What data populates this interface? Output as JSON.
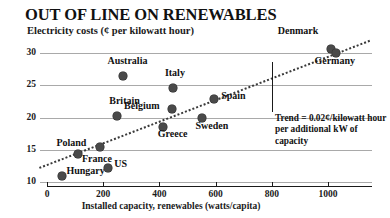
{
  "chart_data": {
    "type": "scatter",
    "title": "OUT OF LINE ON RENEWABLES",
    "subtitle": "Electricity costs (¢ per kilowatt hour)",
    "xlabel": "Installed capacity, renewables (watts/capita)",
    "ylabel": "",
    "xlim": [
      0,
      1150
    ],
    "ylim": [
      9,
      32
    ],
    "xticks": [
      0,
      200,
      400,
      600,
      800,
      1000
    ],
    "xtick_labels": [
      "0",
      "200",
      "400",
      "600",
      "800",
      "1000"
    ],
    "yticks": [
      10,
      15,
      20,
      25,
      30
    ],
    "ytick_labels": [
      "10",
      "15",
      "20",
      "25",
      "30"
    ],
    "grid": true,
    "legend": false,
    "points": [
      {
        "label": "Hungary",
        "x": 55,
        "y": 11.0,
        "label_dx": 4,
        "label_dy": -6
      },
      {
        "label": "France",
        "x": 110,
        "y": 14.3,
        "label_dx": 4,
        "label_dy": 4
      },
      {
        "label": "Poland",
        "x": 190,
        "y": 15.5,
        "label_dx": -44,
        "label_dy": -5
      },
      {
        "label": "US",
        "x": 218,
        "y": 12.1,
        "label_dx": 6,
        "label_dy": -5
      },
      {
        "label": "Britain",
        "x": 250,
        "y": 20.2,
        "label_dx": -8,
        "label_dy": -16
      },
      {
        "label": "Australia",
        "x": 272,
        "y": 26.4,
        "label_dx": -16,
        "label_dy": -16
      },
      {
        "label": "Greece",
        "x": 412,
        "y": 18.6,
        "label_dx": -5,
        "label_dy": 6
      },
      {
        "label": "Belgium",
        "x": 445,
        "y": 21.3,
        "label_dx": -48,
        "label_dy": -4
      },
      {
        "label": "Italy",
        "x": 448,
        "y": 24.5,
        "label_dx": -8,
        "label_dy": -16
      },
      {
        "label": "Sweden",
        "x": 550,
        "y": 19.9,
        "label_dx": -6,
        "label_dy": 7
      },
      {
        "label": "Spain",
        "x": 595,
        "y": 22.9,
        "label_dx": 7,
        "label_dy": -4
      },
      {
        "label": "Denmark",
        "x": 1010,
        "y": 30.6,
        "label_dx": -53,
        "label_dy": -19
      },
      {
        "label": "Germany",
        "x": 1030,
        "y": 30.0,
        "label_dx": -22,
        "label_dy": 7
      }
    ],
    "trend": {
      "annotation": "Trend = 0.02¢/kilowatt hour per additional kW of capacity",
      "annotation_lines": [
        "Trend = 0.02¢/kilowatt",
        "hour per additional kW",
        "of capacity"
      ],
      "style": "dotted",
      "x_start": -30,
      "y_start": 12.3,
      "x_end": 1145,
      "y_end": 32.0
    }
  }
}
